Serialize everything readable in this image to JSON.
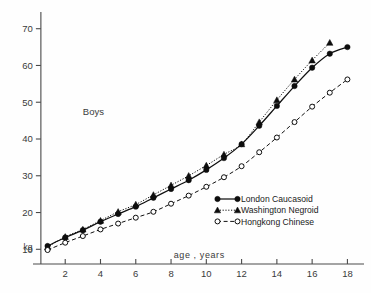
{
  "figure": {
    "panel_label": "Boys",
    "y_unit": "kg",
    "x_axis_title": "age , years"
  },
  "chart_data": {
    "type": "line",
    "title": "Boys",
    "xlabel": "age , years",
    "ylabel": "kg",
    "xlim": [
      0.4,
      18.6
    ],
    "ylim": [
      6,
      74
    ],
    "xticks": [
      2,
      4,
      6,
      8,
      10,
      12,
      14,
      16,
      18
    ],
    "xticklabels": [
      "2",
      "4",
      "6",
      "8",
      "10",
      "12",
      "14",
      "16",
      "18"
    ],
    "yticks": [
      10,
      20,
      30,
      40,
      50,
      60,
      70
    ],
    "yticklabels": [
      "10",
      "20",
      "30",
      "40",
      "50",
      "60",
      "70"
    ],
    "grid": false,
    "legend_position": "inside-lower-right",
    "x": [
      1,
      2,
      3,
      4,
      5,
      6,
      7,
      8,
      9,
      10,
      11,
      12,
      13,
      14,
      15,
      16,
      17,
      18
    ],
    "series": [
      {
        "name": "London Caucasoid",
        "marker": "filled-circle",
        "line": "solid",
        "values": [
          10.9,
          13.2,
          15.2,
          17.5,
          19.6,
          21.6,
          24.0,
          26.4,
          28.8,
          31.6,
          34.8,
          38.6,
          43.6,
          49.0,
          54.4,
          59.4,
          63.2,
          65.0
        ]
      },
      {
        "name": "Washington Negroid",
        "marker": "filled-triangle",
        "line": "dotted",
        "values": [
          10.6,
          13.4,
          15.4,
          17.8,
          20.2,
          22.2,
          24.8,
          27.4,
          30.0,
          32.8,
          35.8,
          38.6,
          44.6,
          50.6,
          56.2,
          61.4,
          66.2,
          null
        ]
      },
      {
        "name": "Hongkong Chinese",
        "marker": "open-circle",
        "line": "dashed",
        "values": [
          9.8,
          11.8,
          13.6,
          15.4,
          17.0,
          18.6,
          20.2,
          22.4,
          24.6,
          27.0,
          29.6,
          32.6,
          36.4,
          40.4,
          44.6,
          48.8,
          52.6,
          56.2
        ]
      }
    ]
  },
  "legend": {
    "items": [
      {
        "label": "London Caucasoid",
        "marker": "filled-circle",
        "line": "solid"
      },
      {
        "label": "Washington Negroid",
        "marker": "filled-triangle",
        "line": "dotted"
      },
      {
        "label": "Hongkong Chinese",
        "marker": "open-circle",
        "line": "dashed"
      }
    ]
  }
}
